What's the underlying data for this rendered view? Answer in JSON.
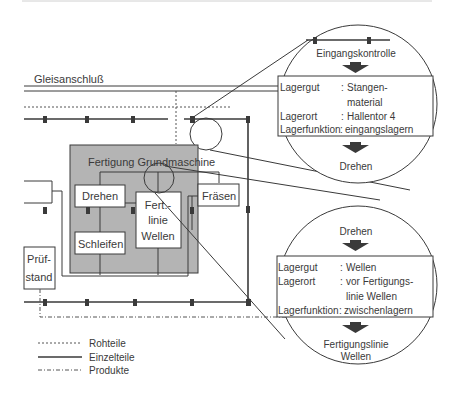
{
  "diagram": {
    "top_rule": true,
    "gleis_label": "Gleisanschluß",
    "main_hall": {
      "title": "Fertigung Grundmaschine",
      "stations": [
        {
          "id": "drehen",
          "label": "Drehen"
        },
        {
          "id": "schleifen",
          "label": "Schleifen"
        },
        {
          "id": "fertlinie",
          "lines": [
            "Fert.-",
            "linie",
            "Wellen"
          ]
        },
        {
          "id": "fraesen",
          "label": "Fräsen"
        }
      ]
    },
    "pruefstand": {
      "lines": [
        "Prüf-",
        "stand"
      ]
    },
    "detail_top": {
      "from": "Eingangskontrolle",
      "to": "Drehen",
      "rows": [
        {
          "key": "Lagergut",
          "sep": ":",
          "value": [
            "Stangen-",
            "material"
          ]
        },
        {
          "key": "Lagerort",
          "sep": ":",
          "value": [
            "Hallentor 4"
          ]
        },
        {
          "key": "Lagerfunktion",
          "sep": ":",
          "value": [
            "eingangslagern"
          ]
        }
      ]
    },
    "detail_bottom": {
      "from": "Drehen",
      "to": [
        "Fertigungslinie",
        "Wellen"
      ],
      "rows": [
        {
          "key": "Lagergut",
          "sep": ":",
          "value": [
            "Wellen"
          ]
        },
        {
          "key": "Lagerort",
          "sep": ":",
          "value": [
            "vor Fertigungs-",
            "linie Wellen"
          ]
        },
        {
          "key": "Lagerfunktion",
          "sep": ":",
          "value": [
            "zwischenlagern"
          ]
        }
      ]
    },
    "legend": [
      {
        "style": "dotted",
        "label": "Rohteile"
      },
      {
        "style": "solid",
        "label": "Einzelteile"
      },
      {
        "style": "dash-dot",
        "label": "Produkte"
      }
    ],
    "colors": {
      "line": "#3a3a3a",
      "hall_fill": "#b4b4b4",
      "box_fill": "#ffffff",
      "text": "#3a3a3a"
    }
  }
}
